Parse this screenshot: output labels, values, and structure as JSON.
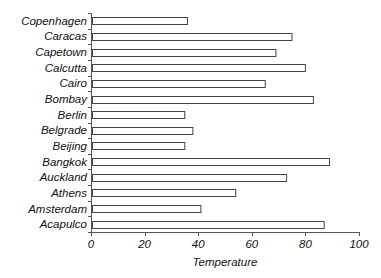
{
  "chart_data": {
    "type": "bar",
    "orientation": "horizontal",
    "title": "",
    "xlabel": "Temperature",
    "ylabel": "",
    "xlim": [
      0,
      100
    ],
    "xticks": [
      0,
      20,
      40,
      60,
      80,
      100
    ],
    "grid": false,
    "legend": null,
    "categories": [
      "Copenhagen",
      "Caracas",
      "Capetown",
      "Calcutta",
      "Cairo",
      "Bombay",
      "Berlin",
      "Belgrade",
      "Beijing",
      "Bangkok",
      "Auckland",
      "Athens",
      "Amsterdam",
      "Acapulco"
    ],
    "values": [
      36,
      75,
      69,
      80,
      65,
      83,
      35,
      38,
      35,
      89,
      73,
      54,
      41,
      87
    ],
    "bar_fill": "#ffffff",
    "bar_stroke": "#444444"
  },
  "labels": {
    "xlabel": "Temperature",
    "xticks": [
      "0",
      "20",
      "40",
      "60",
      "80",
      "100"
    ],
    "categories": [
      "Copenhagen",
      "Caracas",
      "Capetown",
      "Calcutta",
      "Cairo",
      "Bombay",
      "Berlin",
      "Belgrade",
      "Beijing",
      "Bangkok",
      "Auckland",
      "Athens",
      "Amsterdam",
      "Acapulco"
    ]
  }
}
